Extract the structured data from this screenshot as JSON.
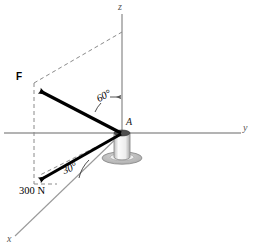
{
  "figure": {
    "axes": {
      "z_label": "z",
      "y_label": "y",
      "x_label": "x"
    },
    "points": {
      "origin_label": "A"
    },
    "vectors": [
      {
        "name": "force-F",
        "label": "F",
        "angle_label": "60°",
        "angle_from": "z-axis"
      },
      {
        "name": "force-300N",
        "label": "300 N",
        "angle_label": "30°",
        "angle_from": "x-y plane projection"
      }
    ],
    "colors": {
      "axis": "#9a9a9a",
      "vector": "#000000",
      "dashed": "#8a8a8a",
      "post_body": "#f2f2f2",
      "post_top": "#4a4a4a",
      "post_base": "#b9b9b9"
    }
  }
}
